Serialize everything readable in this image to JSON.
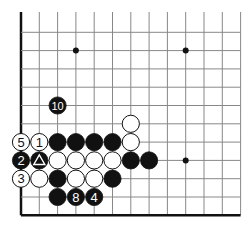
{
  "diagram": {
    "type": "go-board-fragment",
    "grid": {
      "columns": 13,
      "rows": 12,
      "origin_x": 21,
      "origin_y": 14,
      "spacing": 18.3,
      "left_edge": true,
      "bottom_edge": true,
      "line_color": "#888888",
      "edge_color": "#111111"
    },
    "star_points": [
      {
        "c": 3,
        "r": 2
      },
      {
        "c": 9,
        "r": 2
      },
      {
        "c": 9,
        "r": 8
      }
    ],
    "stones": [
      {
        "c": 2,
        "r": 5,
        "color": "black",
        "label": "10"
      },
      {
        "c": 6,
        "r": 6,
        "color": "white",
        "label": ""
      },
      {
        "c": 0,
        "r": 7,
        "color": "white",
        "label": "5"
      },
      {
        "c": 1,
        "r": 7,
        "color": "white",
        "label": "1"
      },
      {
        "c": 2,
        "r": 7,
        "color": "black",
        "label": ""
      },
      {
        "c": 3,
        "r": 7,
        "color": "black",
        "label": ""
      },
      {
        "c": 4,
        "r": 7,
        "color": "black",
        "label": ""
      },
      {
        "c": 5,
        "r": 7,
        "color": "black",
        "label": ""
      },
      {
        "c": 6,
        "r": 7,
        "color": "white",
        "label": ""
      },
      {
        "c": 0,
        "r": 8,
        "color": "black",
        "label": "2"
      },
      {
        "c": 1,
        "r": 8,
        "color": "black",
        "label": "△",
        "mark": "triangle"
      },
      {
        "c": 2,
        "r": 8,
        "color": "white",
        "label": ""
      },
      {
        "c": 3,
        "r": 8,
        "color": "white",
        "label": ""
      },
      {
        "c": 4,
        "r": 8,
        "color": "white",
        "label": ""
      },
      {
        "c": 5,
        "r": 8,
        "color": "white",
        "label": ""
      },
      {
        "c": 6,
        "r": 8,
        "color": "black",
        "label": ""
      },
      {
        "c": 7,
        "r": 8,
        "color": "black",
        "label": ""
      },
      {
        "c": 0,
        "r": 9,
        "color": "white",
        "label": "3"
      },
      {
        "c": 1,
        "r": 9,
        "color": "white",
        "label": ""
      },
      {
        "c": 2,
        "r": 9,
        "color": "black",
        "label": ""
      },
      {
        "c": 3,
        "r": 9,
        "color": "white",
        "label": ""
      },
      {
        "c": 4,
        "r": 9,
        "color": "white",
        "label": ""
      },
      {
        "c": 5,
        "r": 9,
        "color": "black",
        "label": ""
      },
      {
        "c": 2,
        "r": 10,
        "color": "black",
        "label": ""
      },
      {
        "c": 3,
        "r": 10,
        "color": "black",
        "label": "8"
      },
      {
        "c": 4,
        "r": 10,
        "color": "black",
        "label": "4"
      }
    ]
  }
}
